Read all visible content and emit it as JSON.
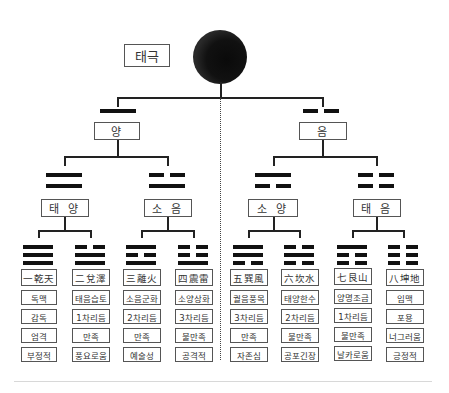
{
  "root": {
    "label": "태극",
    "symbol": "taiji-circle"
  },
  "level1": [
    {
      "label": "양",
      "line": "solid"
    },
    {
      "label": "음",
      "line": "broken"
    }
  ],
  "level2": [
    {
      "label": "태 양",
      "lines_top_to_bottom": [
        "solid",
        "solid"
      ]
    },
    {
      "label": "소 음",
      "lines_top_to_bottom": [
        "broken",
        "solid"
      ]
    },
    {
      "label": "소 양",
      "lines_top_to_bottom": [
        "solid",
        "broken"
      ]
    },
    {
      "label": "태 음",
      "lines_top_to_bottom": [
        "broken",
        "broken"
      ]
    }
  ],
  "trigrams": [
    {
      "label": "一乾天",
      "lines_top_to_bottom": [
        "solid",
        "solid",
        "solid"
      ],
      "attributes": [
        "독맥",
        "감독",
        "엄격",
        "부정적"
      ]
    },
    {
      "label": "二兌澤",
      "lines_top_to_bottom": [
        "broken",
        "solid",
        "solid"
      ],
      "attributes": [
        "태음습토",
        "1차리듬",
        "만족",
        "풍요로움"
      ]
    },
    {
      "label": "三離火",
      "lines_top_to_bottom": [
        "solid",
        "broken",
        "solid"
      ],
      "attributes": [
        "소음군화",
        "2차리듬",
        "만족",
        "예술성"
      ]
    },
    {
      "label": "四震雷",
      "lines_top_to_bottom": [
        "broken",
        "broken",
        "solid"
      ],
      "attributes": [
        "소양상화",
        "3차리듬",
        "불만족",
        "공격적"
      ]
    },
    {
      "label": "五巽風",
      "lines_top_to_bottom": [
        "solid",
        "solid",
        "broken"
      ],
      "attributes": [
        "궐음풍목",
        "3차리듬",
        "만족",
        "자존심"
      ]
    },
    {
      "label": "六坎水",
      "lines_top_to_bottom": [
        "broken",
        "solid",
        "broken"
      ],
      "attributes": [
        "태양한수",
        "2차리듬",
        "불만족",
        "공포긴장"
      ]
    },
    {
      "label": "七艮山",
      "lines_top_to_bottom": [
        "solid",
        "broken",
        "broken"
      ],
      "attributes": [
        "양명조금",
        "1차리듬",
        "불만족",
        "날카로움"
      ]
    },
    {
      "label": "八坤地",
      "lines_top_to_bottom": [
        "broken",
        "broken",
        "broken"
      ],
      "attributes": [
        "임맥",
        "포용",
        "너그러움",
        "긍정적"
      ]
    }
  ],
  "colors": {
    "line": "#222222",
    "bar": "#111111",
    "box_border": "#555555",
    "background": "#ffffff"
  }
}
